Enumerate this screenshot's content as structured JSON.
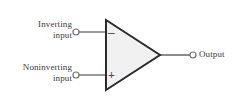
{
  "figure": {
    "kind": "op-amp-schematic",
    "background_color": "#ffffff",
    "width": 242,
    "height": 110
  },
  "colors": {
    "stroke": "#2b2b2b",
    "wire": "#6f6f6f",
    "body_fill": "#f1f1f1",
    "text": "#3b3b3b",
    "terminal_fill": "#ffffff"
  },
  "labels": {
    "inverting_line1": "Inverting",
    "inverting_line2": "input",
    "noninverting_line1": "Noninverting",
    "noninverting_line2": "input",
    "output": "Output"
  },
  "symbols": {
    "inverting_sign": "–",
    "noninverting_sign": "+"
  },
  "geometry": {
    "triangle_points": "106,20 106,90 160,55",
    "inverting_wire": {
      "x1": 79,
      "y1": 32,
      "x2": 106,
      "y2": 32
    },
    "noninverting_wire": {
      "x1": 79,
      "y1": 75,
      "x2": 106,
      "y2": 75
    },
    "output_wire": {
      "x1": 160,
      "y1": 55,
      "x2": 190,
      "y2": 55
    },
    "terminal_inverting": {
      "cx": 76,
      "cy": 32,
      "r": 3
    },
    "terminal_noninverting": {
      "cx": 76,
      "cy": 75,
      "r": 3
    },
    "terminal_output": {
      "cx": 193,
      "cy": 55,
      "r": 3
    }
  }
}
